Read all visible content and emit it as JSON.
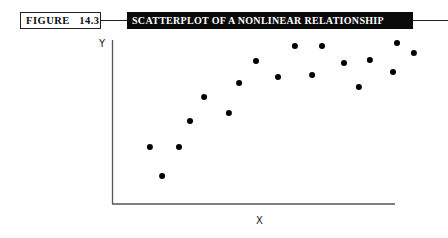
{
  "figure": {
    "label": "FIGURE   14.3",
    "title": "SCATTERPLOT OF A NONLINEAR RELATIONSHIP"
  },
  "axes": {
    "x_label": "X",
    "y_label": "Y"
  },
  "colors": {
    "title_bar_bg": "#0a0a0a",
    "title_text": "#ffffff",
    "points": "#000000",
    "axis": "#555555"
  },
  "chart_data": {
    "type": "scatter",
    "title": "SCATTERPLOT OF A NONLINEAR RELATIONSHIP",
    "figure_number": "14.3",
    "xlabel": "X",
    "ylabel": "Y",
    "xlim": [
      0,
      110
    ],
    "ylim": [
      0,
      100
    ],
    "grid": false,
    "legend": null,
    "tick_labels": false,
    "series": [
      {
        "name": "observations",
        "points": [
          {
            "x": 13.1,
            "y": 34.8
          },
          {
            "x": 17.4,
            "y": 17.1
          },
          {
            "x": 23.4,
            "y": 34.8
          },
          {
            "x": 27.3,
            "y": 50.6
          },
          {
            "x": 32.3,
            "y": 65.2
          },
          {
            "x": 41.1,
            "y": 55.5
          },
          {
            "x": 44.7,
            "y": 73.8
          },
          {
            "x": 50.7,
            "y": 87.2
          },
          {
            "x": 58.5,
            "y": 77.4
          },
          {
            "x": 64.5,
            "y": 96.3
          },
          {
            "x": 70.6,
            "y": 78.7
          },
          {
            "x": 74.1,
            "y": 96.3
          },
          {
            "x": 81.9,
            "y": 86.0
          },
          {
            "x": 87.2,
            "y": 71.3
          },
          {
            "x": 91.1,
            "y": 87.8
          },
          {
            "x": 99.3,
            "y": 80.5
          },
          {
            "x": 100.7,
            "y": 98.2
          },
          {
            "x": 106.7,
            "y": 92.1
          }
        ]
      }
    ]
  }
}
